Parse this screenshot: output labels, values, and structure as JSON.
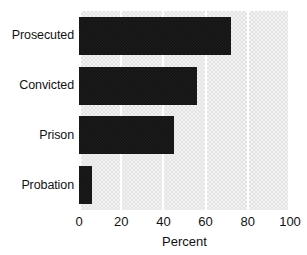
{
  "chart_data": {
    "type": "bar",
    "orientation": "horizontal",
    "title": "",
    "xlabel": "Percent",
    "ylabel": "",
    "categories": [
      "Prosecuted",
      "Convicted",
      "Prison",
      "Probation"
    ],
    "values": [
      72,
      56,
      45,
      6
    ],
    "xlim": [
      0,
      100
    ],
    "xticks": [
      0,
      20,
      40,
      60,
      80,
      100
    ],
    "xtick_labels": [
      "0",
      "20",
      "40",
      "60",
      "80",
      "100"
    ],
    "grid": true,
    "grid_axis": "x",
    "legend": false,
    "colors": {
      "bar": "#141414",
      "plot_background": "#e3e3e3",
      "gridline": "#ffffff",
      "text": "#121212",
      "figure_background": "#ffffff"
    }
  }
}
